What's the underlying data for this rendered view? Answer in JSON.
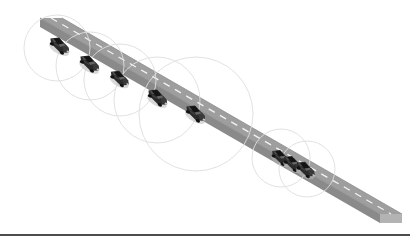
{
  "figure": {
    "width": 410,
    "height": 245,
    "background_color": "#ffffff"
  },
  "road": {
    "name": "highway-road",
    "surface_color": "#9e9e9e",
    "edge_color": "#8a8a8a",
    "side_face_color": "#b3b3b3",
    "lane_marking_color": "#f2f2f2",
    "lane_marking_style": "dashed",
    "start_point": [
      40,
      18
    ],
    "end_point": [
      402,
      214
    ],
    "width_px": 40,
    "thickness_px": 9,
    "surface_polygon": "40,18 62,18 402,214 402,224 380,224 40,28",
    "top_polygon": "40,18 62,18 402,214 380,214",
    "side_polygon": "380,214 402,214 402,224 380,224",
    "left_cap_polygon": "40,18 40,28 62,28 62,18",
    "centerline": {
      "x1": 51,
      "y1": 23,
      "x2": 391,
      "y2": 219,
      "dash": "7 6"
    },
    "inner_edge": {
      "x1": 40,
      "y1": 28,
      "x2": 380,
      "y2": 224
    },
    "outer_edge": {
      "x1": 62,
      "y1": 18,
      "x2": 402,
      "y2": 214
    }
  },
  "coverage_circles": {
    "name": "communication-range-circles",
    "stroke_color": "#dedede",
    "stroke_width": 0.9,
    "fill": "none",
    "items": [
      {
        "label": "range-1",
        "cx": 57,
        "cy": 48,
        "r": 33
      },
      {
        "label": "range-2",
        "cx": 90,
        "cy": 66,
        "r": 34
      },
      {
        "label": "range-3",
        "cx": 120,
        "cy": 80,
        "r": 36
      },
      {
        "label": "range-4",
        "cx": 157,
        "cy": 100,
        "r": 43
      },
      {
        "label": "range-5",
        "cx": 196,
        "cy": 114,
        "r": 57
      },
      {
        "label": "range-6",
        "cx": 281,
        "cy": 158,
        "r": 29
      },
      {
        "label": "range-7",
        "cx": 307,
        "cy": 169,
        "r": 28
      }
    ]
  },
  "vehicles": {
    "name": "vehicles-on-road",
    "body_color": "#2b2b2b",
    "roof_color": "#1a1a1a",
    "window_color": "#6e6e6e",
    "shadow_color": "#b8b8b8",
    "count": 8,
    "items": [
      {
        "label": "vehicle-1",
        "x": 60,
        "y": 45,
        "scale": 1.0
      },
      {
        "label": "vehicle-2",
        "x": 90,
        "y": 63,
        "scale": 1.0
      },
      {
        "label": "vehicle-3",
        "x": 120,
        "y": 78,
        "scale": 0.95
      },
      {
        "label": "vehicle-4",
        "x": 158,
        "y": 97,
        "scale": 1.0
      },
      {
        "label": "vehicle-5",
        "x": 196,
        "y": 113,
        "scale": 1.0
      },
      {
        "label": "vehicle-6",
        "x": 281,
        "y": 157,
        "scale": 0.92
      },
      {
        "label": "vehicle-7",
        "x": 293,
        "y": 163,
        "scale": 0.92
      },
      {
        "label": "vehicle-8",
        "x": 306,
        "y": 169,
        "scale": 0.95
      }
    ]
  },
  "footer_rule": {
    "name": "page-separator-rule",
    "color": "#111111",
    "y": 235,
    "x1": 0,
    "x2": 410,
    "thickness": 1.6
  }
}
